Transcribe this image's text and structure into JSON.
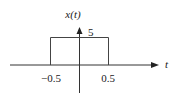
{
  "diagram": {
    "type": "signal-plot",
    "y_axis_label": "x(t)",
    "x_axis_label": "t",
    "amplitude_label": "5",
    "tick_labels": [
      "−0.5",
      "0.5"
    ],
    "pulse": {
      "start": -0.5,
      "end": 0.5,
      "height": 5
    },
    "colors": {
      "line": "#333333",
      "axis": "#333333",
      "background": "#ffffff"
    }
  }
}
